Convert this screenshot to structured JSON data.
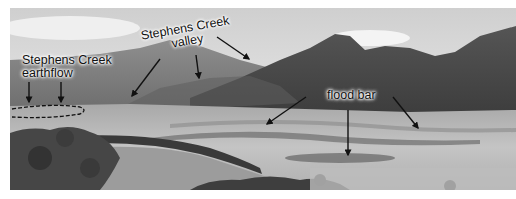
{
  "figure": {
    "type": "annotated-landscape-photograph",
    "color_mode": "grayscale",
    "labels": {
      "earthflow": {
        "line1": "Stephens Creek",
        "line2": "earthflow"
      },
      "valley": {
        "line1": "Stephens Creek",
        "line2": "valley"
      },
      "flood_bar": {
        "text": "flood bar"
      }
    },
    "annotations": {
      "earthflow_arrow_count": 2,
      "valley_arrow_count": 3,
      "flood_bar_arrow_count": 3,
      "earthflow_outline": "dashed-ellipse"
    },
    "colors": {
      "sky": "#e4e4e4",
      "mountain_far": "#8a8a8a",
      "mountain_dark": "#4a4a4a",
      "meadow": "#b8b8b8",
      "river": "#9a9a9a",
      "trees": "#3a3a3a",
      "label_text": "#111111",
      "arrow": "#111111"
    }
  }
}
